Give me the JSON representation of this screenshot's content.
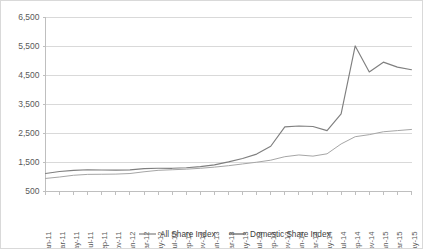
{
  "chart_data": {
    "type": "line",
    "title": "",
    "subtitle": "",
    "xlabel": "",
    "ylabel": "",
    "ylim": [
      500,
      6500
    ],
    "ytick_step": 1000,
    "ytick_labels": [
      "6,500",
      "5,500",
      "4,500",
      "3,500",
      "2,500",
      "1,500",
      "500"
    ],
    "ytick_values": [
      6500,
      5500,
      4500,
      3500,
      2500,
      1500,
      500
    ],
    "grid": true,
    "legend_position": "bottom",
    "categories": [
      "Jan-11",
      "Mar-11",
      "May-11",
      "Jul-11",
      "Sep-11",
      "Nov-11",
      "Jan-12",
      "Mar-12",
      "May-12",
      "Jul-12",
      "Sep-12",
      "Nov-12",
      "Jan-13",
      "Mar-13",
      "May-13",
      "Jul-13",
      "Sep-13",
      "Nov-13",
      "Jan-14",
      "Mar-14",
      "May-14",
      "Jul-14",
      "Sep-14",
      "Nov-14",
      "Jan-15",
      "Mar-15",
      "May-15"
    ],
    "series": [
      {
        "name": "All Share Index",
        "color": "#7f7f7f",
        "values": [
          1120,
          1190,
          1230,
          1250,
          1240,
          1235,
          1245,
          1290,
          1300,
          1300,
          1320,
          1360,
          1420,
          1520,
          1640,
          1790,
          2060,
          2730,
          2760,
          2740,
          2600,
          3180,
          5520,
          4620,
          4960,
          4790,
          4700
        ]
      },
      {
        "name": "Domestic Share Index",
        "color": "#a6a6a6",
        "values": [
          950,
          1000,
          1060,
          1090,
          1095,
          1100,
          1120,
          1180,
          1230,
          1250,
          1270,
          1300,
          1340,
          1390,
          1450,
          1510,
          1580,
          1700,
          1760,
          1720,
          1800,
          2140,
          2390,
          2460,
          2560,
          2600,
          2640
        ]
      }
    ]
  },
  "legend": {
    "items": [
      {
        "label": "All Share Index",
        "color": "#7f7f7f"
      },
      {
        "label": "Domestic Share Index",
        "color": "#595959"
      }
    ]
  }
}
